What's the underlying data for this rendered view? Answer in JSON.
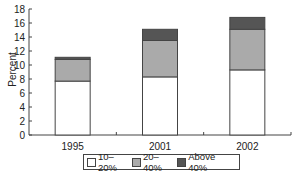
{
  "chart_data": {
    "type": "bar",
    "stacked": true,
    "title": "",
    "xlabel": "",
    "ylabel": "Percent",
    "ylim": [
      0,
      18
    ],
    "yticks": [
      0,
      2,
      4,
      6,
      8,
      10,
      12,
      14,
      16,
      18
    ],
    "categories": [
      "1995",
      "2001",
      "2002"
    ],
    "series": [
      {
        "name": "10–20%",
        "color": "#ffffff",
        "values": [
          7.7,
          8.3,
          9.3
        ]
      },
      {
        "name": "20–40%",
        "color": "#aaaaaa",
        "values": [
          3.1,
          5.2,
          5.8
        ]
      },
      {
        "name": "Above 40%",
        "color": "#555555",
        "values": [
          0.3,
          1.6,
          1.7
        ]
      }
    ],
    "grid": false,
    "legend_position": "bottom"
  },
  "legend": {
    "items": [
      {
        "label": "10–20%",
        "color": "#ffffff"
      },
      {
        "label": "20–40%",
        "color": "#aaaaaa"
      },
      {
        "label": "Above 40%",
        "color": "#555555"
      }
    ]
  }
}
